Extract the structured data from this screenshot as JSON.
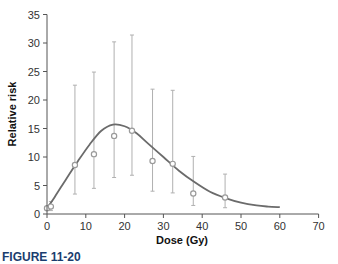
{
  "chart_data": {
    "type": "scatter",
    "title": "",
    "xlabel": "Dose (Gy)",
    "ylabel": "Relative risk",
    "xlim": [
      0,
      70
    ],
    "ylim": [
      0,
      35
    ],
    "xticks": [
      0,
      10,
      20,
      30,
      40,
      50,
      60,
      70
    ],
    "yticks": [
      0,
      5,
      10,
      15,
      20,
      25,
      30,
      35
    ],
    "grid": false,
    "legend": null,
    "series": [
      {
        "name": "Observed relative risk (with 95% CI)",
        "kind": "scatter_errorbar",
        "points": [
          {
            "x": 0.0,
            "y": 1.0,
            "lower": 1.0,
            "upper": 1.0
          },
          {
            "x": 1.0,
            "y": 1.3,
            "lower": 0.6,
            "upper": 2.2
          },
          {
            "x": 7.2,
            "y": 8.6,
            "lower": 3.5,
            "upper": 22.6
          },
          {
            "x": 12.1,
            "y": 10.5,
            "lower": 4.5,
            "upper": 24.9
          },
          {
            "x": 17.3,
            "y": 13.7,
            "lower": 6.4,
            "upper": 30.2
          },
          {
            "x": 21.9,
            "y": 14.6,
            "lower": 6.8,
            "upper": 31.4
          },
          {
            "x": 27.2,
            "y": 9.3,
            "lower": 4.0,
            "upper": 21.9
          },
          {
            "x": 32.4,
            "y": 8.8,
            "lower": 3.7,
            "upper": 21.7
          },
          {
            "x": 37.7,
            "y": 3.6,
            "lower": 1.5,
            "upper": 10.1
          },
          {
            "x": 45.9,
            "y": 2.9,
            "lower": 1.1,
            "upper": 7.0
          }
        ]
      },
      {
        "name": "Fitted dose-response curve",
        "kind": "line",
        "x": [
          0,
          2,
          5,
          8,
          11,
          14,
          17,
          20,
          23,
          26,
          30,
          34,
          38,
          42,
          46,
          50,
          54,
          57,
          60
        ],
        "y": [
          1.0,
          3.0,
          6.2,
          9.3,
          12.2,
          14.6,
          15.7,
          15.4,
          14.2,
          12.4,
          10.0,
          7.6,
          5.6,
          3.9,
          2.8,
          2.0,
          1.5,
          1.3,
          1.2
        ]
      }
    ],
    "caption": "FIGURE 11-20"
  },
  "axes": {
    "x_tick_labels": [
      "0",
      "10",
      "20",
      "30",
      "40",
      "50",
      "60",
      "70"
    ],
    "y_tick_labels": [
      "0",
      "5",
      "10",
      "15",
      "20",
      "25",
      "30",
      "35"
    ],
    "xlabel": "Dose (Gy)",
    "ylabel": "Relative risk"
  },
  "caption": "FIGURE 11-20",
  "colors": {
    "curve": "#6b6b6b",
    "errorbar": "#b0b0b0",
    "marker": "#9a9a9a",
    "axis": "#555555",
    "caption": "#1a3d6e"
  }
}
